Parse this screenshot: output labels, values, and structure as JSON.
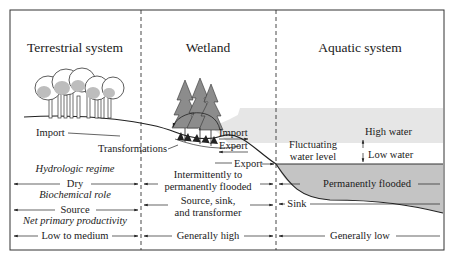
{
  "sections": {
    "terrestrial": {
      "title": "Terrestrial system"
    },
    "wetland": {
      "title": "Wetland"
    },
    "aquatic": {
      "title": "Aquatic system"
    }
  },
  "flows": {
    "import_terrestrial": "Import",
    "transformations": "Transformations",
    "import_wetland": "Import",
    "export_wetland": "Export",
    "export_lower": "Export"
  },
  "water": {
    "fluctuating_1": "Fluctuating",
    "fluctuating_2": "water level",
    "high_water": "High water",
    "low_water": "Low water"
  },
  "rows": {
    "hydrologic_regime": {
      "heading": "Hydrologic regime",
      "terrestrial": "Dry",
      "wetland_1": "Intermittently to",
      "wetland_2": "permanently flooded",
      "aquatic": "Permanently flooded"
    },
    "biochemical_role": {
      "heading": "Biochemical role",
      "terrestrial": "Source",
      "wetland_1": "Source, sink,",
      "wetland_2": "and transformer",
      "aquatic": "Sink"
    },
    "net_primary_productivity": {
      "heading": "Net primary productivity",
      "terrestrial": "Low to medium",
      "wetland": "Generally high",
      "aquatic": "Generally low"
    }
  },
  "colors": {
    "border": "#333333",
    "shallow_water": "#e6e6e6",
    "deep_water": "#c4c4c4",
    "tree_fill": "#bdbdbd",
    "conifer_fill": "#8c8c8c"
  }
}
